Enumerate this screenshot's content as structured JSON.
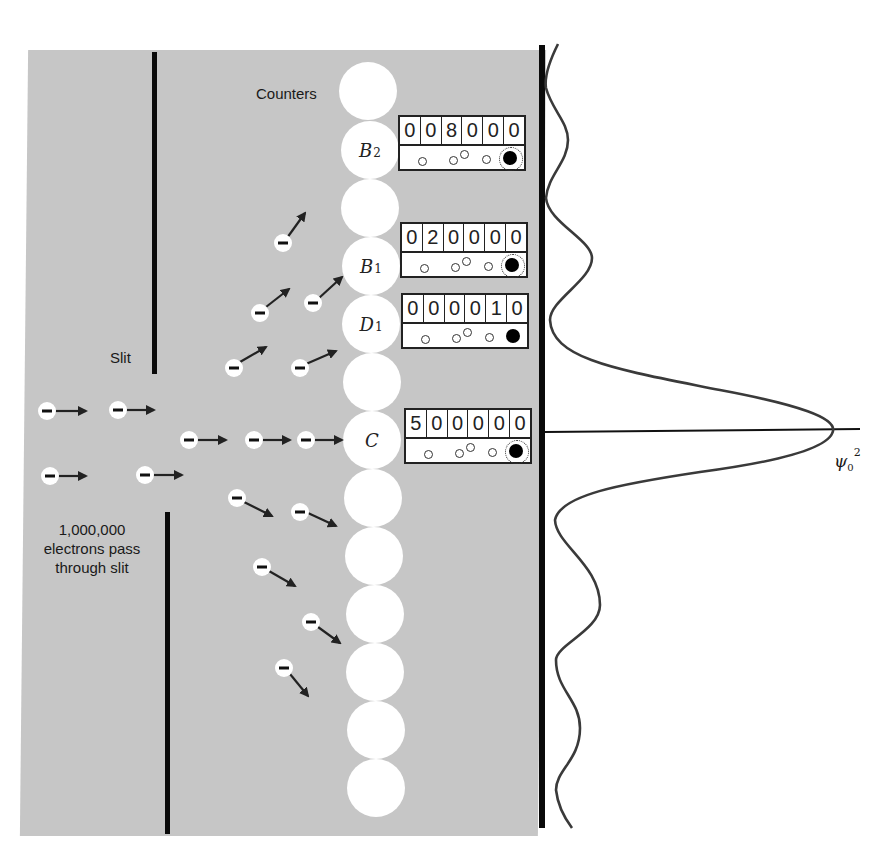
{
  "labels": {
    "counters": "Counters",
    "slit": "Slit",
    "electrons_line1": "1,000,000",
    "electrons_line2": "electrons pass",
    "electrons_line3": "through slit",
    "probability_label": "ψ",
    "probability_sub": "0",
    "probability_sup": "2"
  },
  "colors": {
    "panel": "#c6c6c6",
    "wall": "#0a0a0a",
    "curve": "#3a3a3a",
    "counter": "#ffffff"
  },
  "counters": [
    {
      "id": "top",
      "label": "",
      "sub": ""
    },
    {
      "id": "B2",
      "label": "B",
      "sub": "2"
    },
    {
      "id": "gap1",
      "label": "",
      "sub": ""
    },
    {
      "id": "B1",
      "label": "B",
      "sub": "1"
    },
    {
      "id": "D1",
      "label": "D",
      "sub": "1"
    },
    {
      "id": "gap2",
      "label": "",
      "sub": ""
    },
    {
      "id": "C",
      "label": "C",
      "sub": ""
    },
    {
      "id": "c8",
      "label": "",
      "sub": ""
    },
    {
      "id": "c9",
      "label": "",
      "sub": ""
    },
    {
      "id": "c10",
      "label": "",
      "sub": ""
    },
    {
      "id": "c11",
      "label": "",
      "sub": ""
    },
    {
      "id": "c12",
      "label": "",
      "sub": ""
    },
    {
      "id": "c13",
      "label": "",
      "sub": ""
    },
    {
      "id": "c14",
      "label": "",
      "sub": ""
    }
  ],
  "meters": [
    {
      "counter": "B2",
      "digits": [
        "0",
        "0",
        "8",
        "0",
        "0",
        "0"
      ],
      "lamp_glowing": true
    },
    {
      "counter": "B1",
      "digits": [
        "0",
        "2",
        "0",
        "0",
        "0",
        "0"
      ],
      "lamp_glowing": true
    },
    {
      "counter": "D1",
      "digits": [
        "0",
        "0",
        "0",
        "0",
        "1",
        "0"
      ],
      "lamp_glowing": false
    },
    {
      "counter": "C",
      "digits": [
        "5",
        "0",
        "0",
        "0",
        "0",
        "0"
      ],
      "lamp_glowing": true
    }
  ],
  "electron_symbol": "−"
}
